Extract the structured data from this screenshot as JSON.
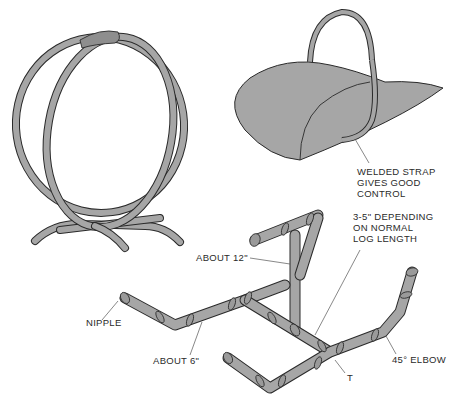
{
  "figure": {
    "illustrations": [
      {
        "id": "hoop-log-holder",
        "description": "Double-hoop tubular log holder with padded grip"
      },
      {
        "id": "log-scoop",
        "description": "Sheet-metal log carrier with welded strap handle"
      },
      {
        "id": "pipe-log-rack",
        "description": "Pipe-fitting log rack assembly"
      }
    ],
    "colors": {
      "fill": "#a6a6a6",
      "fill_dark": "#8e8e8e",
      "outline": "#2a2a2a",
      "text": "#2a2a2a",
      "leader": "#555555"
    },
    "labels": {
      "welded_strap": [
        "WELDED STRAP",
        "GIVES GOOD",
        "CONTROL"
      ],
      "depending": [
        "3-5\" DEPENDING",
        "ON NORMAL",
        "LOG LENGTH"
      ],
      "about_12": "ABOUT 12\"",
      "nipple": "NIPPLE",
      "about_6": "ABOUT 6\"",
      "elbow_45": "45° ELBOW",
      "tee": "T"
    }
  }
}
